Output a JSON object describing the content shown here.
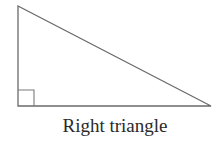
{
  "figure": {
    "caption": "Right triangle",
    "shape": "right-triangle",
    "vertices": {
      "top": [
        18,
        6
      ],
      "right_angle": [
        18,
        106
      ],
      "right": [
        211,
        106
      ]
    },
    "right_angle_marker_size": 16,
    "stroke_color": "#6a6a6a"
  }
}
